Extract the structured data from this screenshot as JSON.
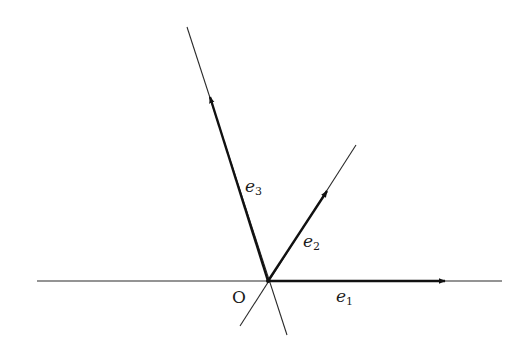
{
  "diagram": {
    "title": "",
    "origin": {
      "label": "O",
      "x": 268,
      "y": 281
    },
    "lines": [
      {
        "name": "horizontal-axis",
        "x1": 37,
        "y1": 281,
        "x2": 502,
        "y2": 281
      },
      {
        "name": "e2-line",
        "x1": 240,
        "y1": 326,
        "x2": 356,
        "y2": 145
      },
      {
        "name": "e3-line",
        "x1": 187,
        "y1": 27,
        "x2": 287,
        "y2": 335
      }
    ],
    "vectors": [
      {
        "name": "e1",
        "label_base": "e",
        "label_sub": "1",
        "x1": 268,
        "y1": 281,
        "x2": 445,
        "y2": 281,
        "label_x": 336,
        "label_y": 288
      },
      {
        "name": "e2",
        "label_base": "e",
        "label_sub": "2",
        "x1": 268,
        "y1": 281,
        "x2": 327,
        "y2": 191,
        "label_x": 303,
        "label_y": 233
      },
      {
        "name": "e3",
        "label_base": "e",
        "label_sub": "3",
        "x1": 268,
        "y1": 281,
        "x2": 210,
        "y2": 97,
        "label_x": 245,
        "label_y": 178
      }
    ],
    "colors": {
      "line": "#2a2a2a",
      "vector": "#111111",
      "background": "#ffffff"
    }
  }
}
